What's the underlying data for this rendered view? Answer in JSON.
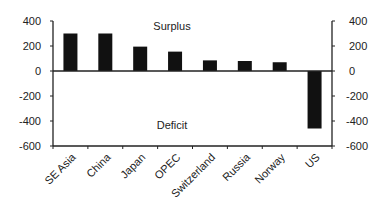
{
  "chart_data": {
    "type": "bar",
    "title": "",
    "xlabel": "",
    "ylabel": "",
    "categories": [
      "SE Asia",
      "China",
      "Japan",
      "OPEC",
      "Switzerland",
      "Russia",
      "Norway",
      "US"
    ],
    "values": [
      300,
      300,
      195,
      155,
      85,
      80,
      70,
      -460
    ],
    "ylim": [
      -600,
      400
    ],
    "yticks": [
      400,
      200,
      0,
      -200,
      -400,
      -600
    ],
    "secondary_yticks": [
      400,
      200,
      0,
      -200,
      -400,
      -600
    ],
    "annotations": [
      {
        "text": "Surplus",
        "position": "upper-center"
      },
      {
        "text": "Deficit",
        "position": "lower-center"
      }
    ],
    "grid": false,
    "legend": "none",
    "bar_color": "#111111"
  }
}
